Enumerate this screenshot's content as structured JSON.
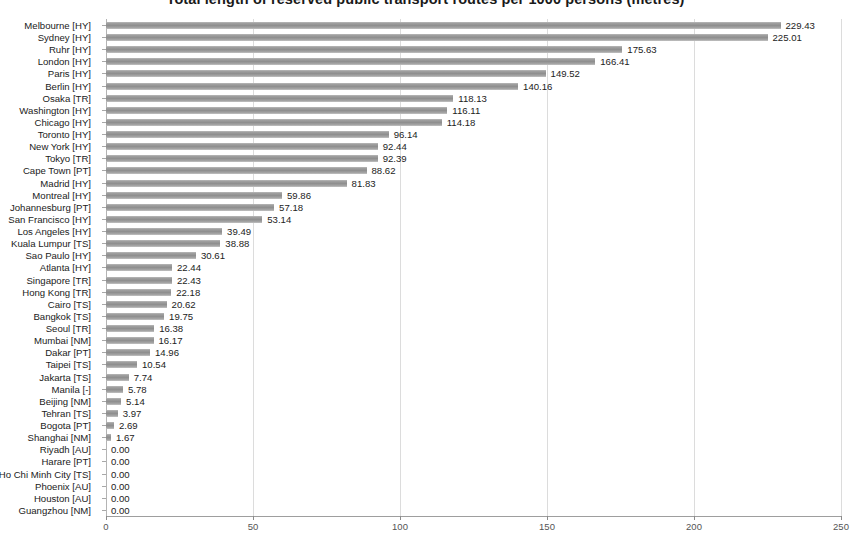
{
  "chart_data": {
    "type": "bar",
    "orientation": "horizontal",
    "title": "Total length of reserved public transport routes per 1000 persons (metres)",
    "xlabel": "",
    "ylabel": "",
    "xlim": [
      0,
      250
    ],
    "xticks": [
      0,
      50,
      100,
      150,
      200,
      250
    ],
    "xtick_labels": [
      "0",
      "50",
      "100",
      "150",
      "200",
      "250"
    ],
    "grid": true,
    "legend": "none",
    "bar_color": "#9a9a9a",
    "value_label_format": "0.00",
    "categories": [
      "Melbourne [HY]",
      "Sydney [HY]",
      "Ruhr [HY]",
      "London [HY]",
      "Paris [HY]",
      "Berlin [HY]",
      "Osaka [TR]",
      "Washington [HY]",
      "Chicago [HY]",
      "Toronto [HY]",
      "New York [HY]",
      "Tokyo [TR]",
      "Cape Town [PT]",
      "Madrid [HY]",
      "Montreal [HY]",
      "Johannesburg [PT]",
      "San Francisco [HY]",
      "Los Angeles [HY]",
      "Kuala Lumpur [TS]",
      "Sao Paulo [HY]",
      "Atlanta [HY]",
      "Singapore [TR]",
      "Hong Kong [TR]",
      "Cairo [TS]",
      "Bangkok [TS]",
      "Seoul [TR]",
      "Mumbai [NM]",
      "Dakar [PT]",
      "Taipei [TS]",
      "Jakarta [TS]",
      "Manila [-]",
      "Beijing [NM]",
      "Tehran [TS]",
      "Bogota [PT]",
      "Shanghai [NM]",
      "Riyadh [AU]",
      "Harare [PT]",
      "Ho Chi Minh City [TS]",
      "Phoenix [AU]",
      "Houston [AU]",
      "Guangzhou [NM]"
    ],
    "values": [
      229.43,
      225.01,
      175.63,
      166.41,
      149.52,
      140.16,
      118.13,
      116.11,
      114.18,
      96.14,
      92.44,
      92.39,
      88.62,
      81.83,
      59.86,
      57.18,
      53.14,
      39.49,
      38.88,
      30.61,
      22.44,
      22.43,
      22.18,
      20.62,
      19.75,
      16.38,
      16.17,
      14.96,
      10.54,
      7.74,
      5.78,
      5.14,
      3.97,
      2.69,
      1.67,
      0.0,
      0.0,
      0.0,
      0.0,
      0.0,
      0.0
    ],
    "value_labels": [
      "229.43",
      "225.01",
      "175.63",
      "166.41",
      "149.52",
      "140.16",
      "118.13",
      "116.11",
      "114.18",
      "96.14",
      "92.44",
      "92.39",
      "88.62",
      "81.83",
      "59.86",
      "57.18",
      "53.14",
      "39.49",
      "38.88",
      "30.61",
      "22.44",
      "22.43",
      "22.18",
      "20.62",
      "19.75",
      "16.38",
      "16.17",
      "14.96",
      "10.54",
      "7.74",
      "5.78",
      "5.14",
      "3.97",
      "2.69",
      "1.67",
      "0.00",
      "0.00",
      "0.00",
      "0.00",
      "0.00",
      "0.00"
    ]
  }
}
